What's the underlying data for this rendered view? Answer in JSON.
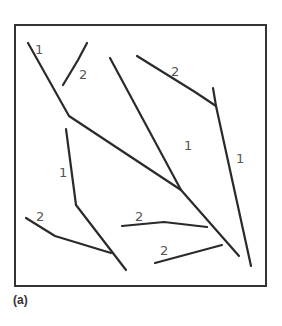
{
  "figure": {
    "caption": "(a)",
    "frame": {
      "x": 15,
      "y": 25,
      "width": 251,
      "height": 261
    },
    "stroke_color": "#2a2a2a",
    "segments": [
      {
        "id": "order1-main-left",
        "order": 1,
        "points": [
          [
            28,
            43
          ],
          [
            69,
            116
          ],
          [
            181,
            190
          ],
          [
            239,
            256
          ]
        ]
      },
      {
        "id": "order2-upper-left",
        "order": 2,
        "points": [
          [
            63,
            85
          ],
          [
            78,
            60
          ],
          [
            87,
            43
          ]
        ]
      },
      {
        "id": "order1-center",
        "order": 1,
        "points": [
          [
            110,
            58
          ],
          [
            181,
            190
          ]
        ]
      },
      {
        "id": "order2-top-right",
        "order": 2,
        "points": [
          [
            137,
            56
          ],
          [
            195,
            92
          ],
          [
            216,
            106
          ]
        ]
      },
      {
        "id": "order1-right",
        "order": 1,
        "points": [
          [
            213,
            88
          ],
          [
            216,
            106
          ],
          [
            251,
            266
          ]
        ]
      },
      {
        "id": "order1-left-middle",
        "order": 1,
        "points": [
          [
            66,
            129
          ],
          [
            76,
            205
          ],
          [
            126,
            270
          ]
        ]
      },
      {
        "id": "order2-lower-left",
        "order": 2,
        "points": [
          [
            26,
            218
          ],
          [
            55,
            236
          ],
          [
            111,
            253
          ]
        ]
      },
      {
        "id": "order2-middle",
        "order": 2,
        "points": [
          [
            122,
            226
          ],
          [
            164,
            222
          ],
          [
            207,
            227
          ]
        ]
      },
      {
        "id": "order2-bottom",
        "order": 2,
        "points": [
          [
            155,
            263
          ],
          [
            222,
            245
          ]
        ]
      }
    ],
    "labels": [
      {
        "text": "1",
        "x": 35,
        "y": 54
      },
      {
        "text": "2",
        "x": 79,
        "y": 79
      },
      {
        "text": "2",
        "x": 171,
        "y": 76
      },
      {
        "text": "1",
        "x": 184,
        "y": 150
      },
      {
        "text": "1",
        "x": 59,
        "y": 177
      },
      {
        "text": "1",
        "x": 236,
        "y": 163
      },
      {
        "text": "2",
        "x": 36,
        "y": 221
      },
      {
        "text": "2",
        "x": 135,
        "y": 221
      },
      {
        "text": "2",
        "x": 160,
        "y": 255
      }
    ]
  }
}
